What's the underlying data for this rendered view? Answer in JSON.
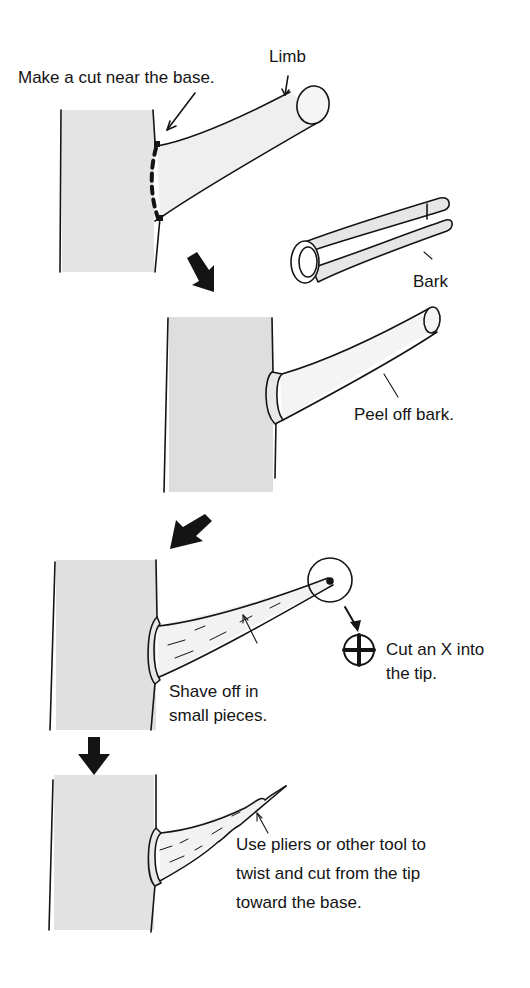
{
  "diagram": {
    "colors": {
      "ink": "#141414",
      "trunk_fill": "#e4e4e4",
      "limb_fill": "#efefef",
      "background": "#ffffff"
    },
    "step1": {
      "instruction": "Make a cut near the base.",
      "limb_label": "Limb"
    },
    "bark_piece": {
      "label": "Bark"
    },
    "step2": {
      "instruction": "Peel off bark."
    },
    "step3": {
      "instruction_line1": "Shave off in",
      "instruction_line2": "small pieces.",
      "tip_line1": "Cut an X into",
      "tip_line2": "the tip."
    },
    "step4": {
      "line1": "Use pliers or other tool to",
      "line2": "twist and cut from the tip",
      "line3": "toward the base."
    },
    "icons": [
      "arrow-down-right-icon",
      "arrow-down-left-icon",
      "arrow-down-icon",
      "cross-cut-tip-icon"
    ]
  }
}
